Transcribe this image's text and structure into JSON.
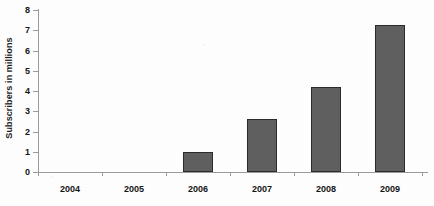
{
  "chart_data": {
    "type": "bar",
    "title": "",
    "subtitle": "",
    "xlabel": "",
    "ylabel": "Subscribers in millions",
    "categories": [
      "2004",
      "2005",
      "2006",
      "2007",
      "2008",
      "2009"
    ],
    "values": [
      0,
      0,
      1.0,
      2.6,
      4.2,
      7.25
    ],
    "ylim": [
      0,
      8
    ],
    "ytick_step": 1,
    "ytick_labels": [
      "0",
      "1",
      "2",
      "3",
      "4",
      "5",
      "6",
      "7",
      "8"
    ],
    "grid": false,
    "legend": false,
    "legend_position": "none",
    "bar_fill_color": "#5f5f5f",
    "bar_border_color": "#2b2b2b",
    "axis_color": "#9a9a9a",
    "text_color": "#151515",
    "background_color": "#fdfdfd"
  }
}
